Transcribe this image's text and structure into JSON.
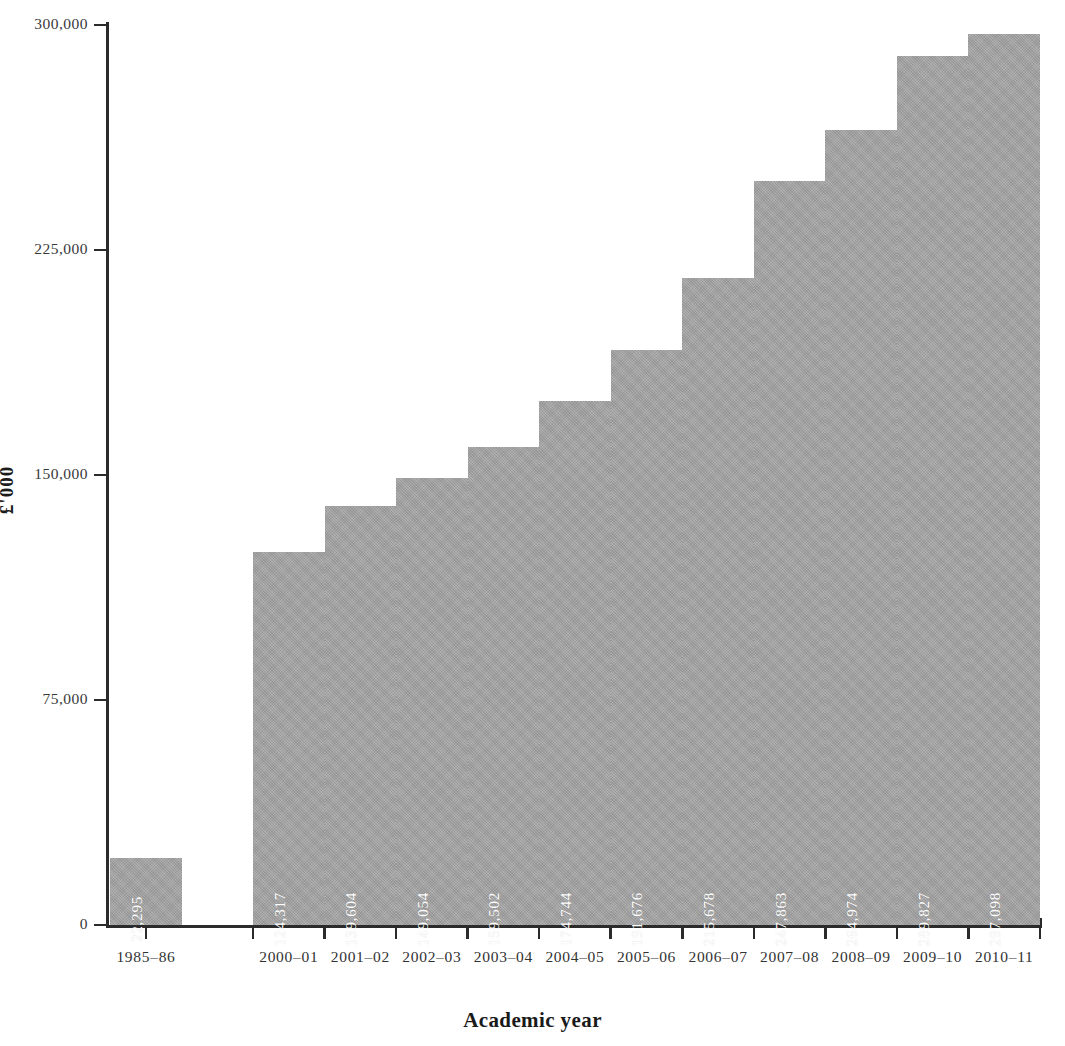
{
  "chart_data": {
    "type": "bar",
    "title": "",
    "xlabel": "Academic year",
    "ylabel": "£'000",
    "categories": [
      "1985–86",
      "2000–01",
      "2001–02",
      "2002–03",
      "2003–04",
      "2004–05",
      "2005–06",
      "2006–07",
      "2007–08",
      "2008–09",
      "2009–10",
      "2010–11"
    ],
    "values": [
      22295,
      124317,
      139604,
      149054,
      159502,
      174744,
      191676,
      215678,
      247863,
      264974,
      289827,
      297098
    ],
    "value_labels": [
      "22,295",
      "124,317",
      "139,604",
      "149,054",
      "159,502",
      "174,744",
      "191,676",
      "215,678",
      "247,863",
      "264,974",
      "289,827",
      "297,098"
    ],
    "ylim": [
      0,
      300000
    ],
    "yticks": [
      0,
      75000,
      150000,
      225000,
      300000
    ],
    "ytick_labels": [
      "0",
      "75,000",
      "150,000",
      "225,000",
      "300,000"
    ],
    "grid": false,
    "legend": null,
    "bar_color": "#a3a3a3",
    "axis_color": "#2b2b2b",
    "value_label_color": "#ffffff",
    "has_gap_after_first_bar": true
  }
}
